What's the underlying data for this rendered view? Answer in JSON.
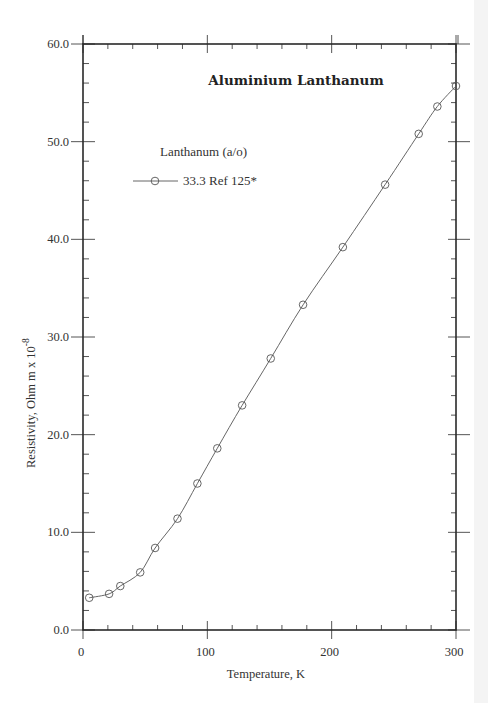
{
  "chart_data": {
    "type": "line",
    "title": "Aluminium Lanthanum",
    "xlabel": "Temperature,  K",
    "ylabel": "Resistivity, Ohm m x 10",
    "ylabel_exponent": "-8",
    "xlim": [
      0,
      300
    ],
    "ylim": [
      0,
      60
    ],
    "x_ticks": [
      0,
      100,
      200,
      300
    ],
    "x_tick_labels": [
      "0",
      "100",
      "200",
      "300"
    ],
    "y_ticks": [
      0,
      10,
      20,
      30,
      40,
      50,
      60
    ],
    "y_tick_labels": [
      "0.0",
      "10.0",
      "20.0",
      "30.0",
      "40.0",
      "50.0",
      "60.0"
    ],
    "x_minor_step": 20,
    "y_minor_step": 2,
    "grid": false,
    "legend": {
      "title": "Lanthanum (a/o)",
      "position": "upper-left",
      "entries": [
        "33.3 Ref 125*"
      ]
    },
    "series": [
      {
        "name": "33.3 Ref 125*",
        "marker": "circle-open",
        "x": [
          5,
          21,
          30,
          46,
          58,
          76,
          92,
          108,
          128,
          151,
          177,
          209,
          243,
          270,
          285,
          300
        ],
        "y": [
          3.3,
          3.7,
          4.5,
          5.9,
          8.4,
          11.4,
          15.0,
          18.6,
          23.0,
          27.8,
          33.3,
          39.2,
          45.6,
          50.8,
          53.6,
          55.7
        ]
      }
    ]
  },
  "colors": {
    "axis": "#2a2a2a",
    "line": "#555555",
    "marker": "#555555",
    "background": "#ffffff"
  }
}
